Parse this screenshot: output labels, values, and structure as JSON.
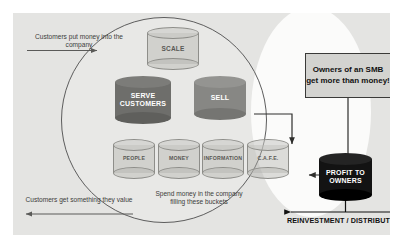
{
  "diagram": {
    "colors": {
      "canvas": "#e4e4e2",
      "highlight_ellipse": "#fbfbfa",
      "circle_outline": "#5d5d5d",
      "bucket_outline": "#8e8e8a",
      "dark_cylinder": "#6e6e6b",
      "mid_cylinder": "#878784",
      "black_cylinder": "#131313",
      "callout_fill": "#d3d3d0",
      "text": "#3d3d3b"
    },
    "labels": {
      "inflow": "Customers put money into the company",
      "outflow": "Customers get something they value",
      "spend": "Spend money in the company filling these buckets",
      "reinvestment": "REINVESTMENT / DISTRIBUTION"
    },
    "callout": {
      "text": "Owners of an SMB get more than money!"
    },
    "cylinders": {
      "scale": "SCALE",
      "serve_customers": "SERVE CUSTOMERS",
      "sell": "SELL",
      "profit": "PROFIT TO OWNERS"
    },
    "buckets": [
      {
        "label": "PEOPLE"
      },
      {
        "label": "MONEY"
      },
      {
        "label": "INFORMATION"
      },
      {
        "label": "C.A.F.E."
      }
    ]
  }
}
